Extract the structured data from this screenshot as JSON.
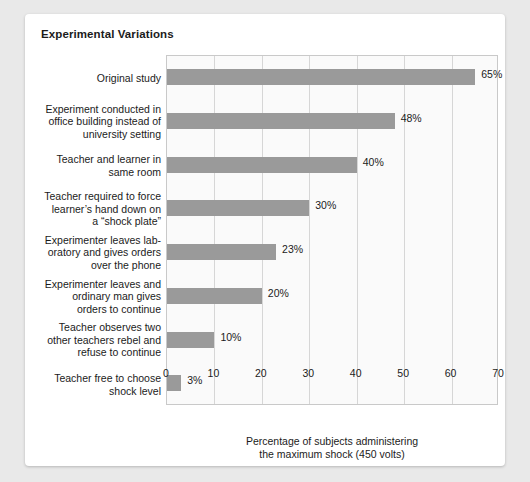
{
  "chart_data": {
    "type": "bar",
    "orientation": "horizontal",
    "title": "Experimental Variations",
    "xlabel": "Percentage of subjects administering the maximum shock (450 volts)",
    "xlabel_lines": [
      "Percentage of subjects administering",
      "the maximum shock (450 volts)"
    ],
    "ylabel": "",
    "xlim": [
      0,
      70
    ],
    "xticks": [
      0,
      10,
      20,
      30,
      40,
      50,
      60,
      70
    ],
    "xtick_labels": [
      "0",
      "10",
      "20",
      "30",
      "40",
      "50",
      "60",
      "70"
    ],
    "grid": true,
    "grid_axis": "x",
    "legend": false,
    "bar_color": "#9a9a9a",
    "plot_background": "#fafafa",
    "categories": [
      "Original study",
      "Experiment conducted in office building instead of university setting",
      "Teacher and learner in same room",
      "Teacher required to force learner’s hand down on a “shock plate”",
      "Experimenter leaves laboratory and gives orders over the phone",
      "Experimenter leaves and ordinary man gives orders to continue",
      "Teacher observes two other teachers rebel and refuse to continue",
      "Teacher free to choose shock level"
    ],
    "values": [
      65,
      48,
      40,
      30,
      23,
      20,
      10,
      3
    ],
    "value_labels": [
      "65%",
      "48%",
      "40%",
      "30%",
      "23%",
      "20%",
      "10%",
      "3%"
    ]
  },
  "rows": [
    {
      "label_lines": [
        "Original study"
      ],
      "value": 65,
      "value_label": "65%"
    },
    {
      "label_lines": [
        "Experiment conducted in",
        "office building instead of",
        "university setting"
      ],
      "value": 48,
      "value_label": "48%"
    },
    {
      "label_lines": [
        "Teacher and learner in",
        "same room"
      ],
      "value": 40,
      "value_label": "40%"
    },
    {
      "label_lines": [
        "Teacher required to force",
        "learner’s hand down on",
        "a “shock plate”"
      ],
      "value": 30,
      "value_label": "30%"
    },
    {
      "label_lines": [
        "Experimenter leaves lab-",
        "oratory and gives orders",
        "over the phone"
      ],
      "value": 23,
      "value_label": "23%"
    },
    {
      "label_lines": [
        "Experimenter leaves and",
        "ordinary man gives",
        "orders to continue"
      ],
      "value": 20,
      "value_label": "20%"
    },
    {
      "label_lines": [
        "Teacher observes two",
        "other teachers rebel and",
        "refuse to continue"
      ],
      "value": 10,
      "value_label": "10%"
    },
    {
      "label_lines": [
        "Teacher free to choose",
        "shock level"
      ],
      "value": 3,
      "value_label": "3%"
    }
  ]
}
